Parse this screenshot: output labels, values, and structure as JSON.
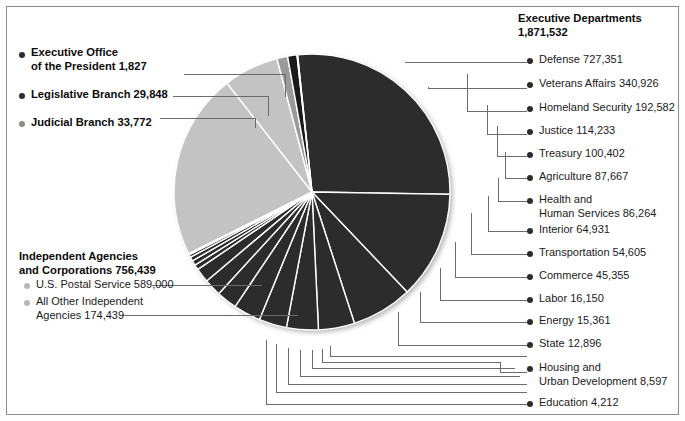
{
  "chart_data": {
    "type": "pie",
    "title": "",
    "unit": "employees",
    "total": 2693418,
    "legend_position": "left-and-right",
    "groups": [
      {
        "name": "Executive Departments",
        "total": "1,871,532",
        "total_value": 1871532,
        "side": "right",
        "bullet": "dark",
        "items": [
          {
            "label": "Defense",
            "value_text": "727,351",
            "value": 727351
          },
          {
            "label": "Veterans Affairs",
            "value_text": "340,926",
            "value": 340926
          },
          {
            "label": "Homeland Security",
            "value_text": "192,582",
            "value": 192582
          },
          {
            "label": "Justice",
            "value_text": "114,233",
            "value": 114233
          },
          {
            "label": "Treasury",
            "value_text": "100,402",
            "value": 100402
          },
          {
            "label": "Agriculture",
            "value_text": "87,667",
            "value": 87667
          },
          {
            "label": "Health and Human Services",
            "label_line1": "Health and",
            "label_line2": "Human Services",
            "value_text": "86,264",
            "value": 86264
          },
          {
            "label": "Interior",
            "value_text": "64,931",
            "value": 64931
          },
          {
            "label": "Transportation",
            "value_text": "54,605",
            "value": 54605
          },
          {
            "label": "Commerce",
            "value_text": "45,355",
            "value": 45355
          },
          {
            "label": "Labor",
            "value_text": "16,150",
            "value": 16150
          },
          {
            "label": "Energy",
            "value_text": "15,361",
            "value": 15361
          },
          {
            "label": "State",
            "value_text": "12,896",
            "value": 12896
          },
          {
            "label": "Housing and Urban Development",
            "label_line1": "Housing and",
            "label_line2": "Urban Development",
            "value_text": "8,597",
            "value": 8597
          },
          {
            "label": "Education",
            "value_text": "4,212",
            "value": 4212
          }
        ]
      },
      {
        "name": "Independent Agencies and Corporations",
        "name_line1": "Independent Agencies",
        "name_line2": "and Corporations",
        "total": "756,439",
        "total_value": 756439,
        "side": "left",
        "bullet": "light",
        "items": [
          {
            "label": "U.S. Postal Service",
            "value_text": "589,000",
            "value": 589000
          },
          {
            "label": "All Other Independent Agencies",
            "label_line1": "All Other Independent",
            "label_line2": "Agencies",
            "value_text": "174,439",
            "value": 174439
          }
        ]
      },
      {
        "name": "Other Branches",
        "side": "left",
        "bullet": "mixed",
        "items": [
          {
            "label": "Executive Office of the President",
            "label_line1": "Executive Office",
            "label_line2": "of the President",
            "value_text": "1,827",
            "value": 1827,
            "bullet": "dark"
          },
          {
            "label": "Legislative Branch",
            "value_text": "29,848",
            "value": 29848,
            "bullet": "dark"
          },
          {
            "label": "Judicial Branch",
            "value_text": "33,772",
            "value": 33772,
            "bullet": "mid"
          }
        ]
      }
    ],
    "slices": [
      {
        "label": "Defense",
        "value": 727351,
        "color": "#2c2c2c"
      },
      {
        "label": "Veterans Affairs",
        "value": 340926,
        "color": "#2c2c2c"
      },
      {
        "label": "Homeland Security",
        "value": 192582,
        "color": "#2c2c2c"
      },
      {
        "label": "Justice",
        "value": 114233,
        "color": "#2c2c2c"
      },
      {
        "label": "Treasury",
        "value": 100402,
        "color": "#2c2c2c"
      },
      {
        "label": "Agriculture",
        "value": 87667,
        "color": "#2c2c2c"
      },
      {
        "label": "Health and Human Services",
        "value": 86264,
        "color": "#2c2c2c"
      },
      {
        "label": "Interior",
        "value": 64931,
        "color": "#2c2c2c"
      },
      {
        "label": "Transportation",
        "value": 54605,
        "color": "#2c2c2c"
      },
      {
        "label": "Commerce",
        "value": 45355,
        "color": "#2c2c2c"
      },
      {
        "label": "Labor",
        "value": 16150,
        "color": "#2c2c2c"
      },
      {
        "label": "Energy",
        "value": 15361,
        "color": "#2c2c2c"
      },
      {
        "label": "State",
        "value": 12896,
        "color": "#2c2c2c"
      },
      {
        "label": "Housing and Urban Development",
        "value": 8597,
        "color": "#2c2c2c"
      },
      {
        "label": "Education",
        "value": 4212,
        "color": "#2c2c2c"
      },
      {
        "label": "U.S. Postal Service",
        "value": 589000,
        "color": "#c3c3c3"
      },
      {
        "label": "All Other Independent Agencies",
        "value": 174439,
        "color": "#c3c3c3"
      },
      {
        "label": "Judicial Branch",
        "value": 33772,
        "color": "#9a9a9a"
      },
      {
        "label": "Legislative Branch",
        "value": 29848,
        "color": "#1a1a1a"
      },
      {
        "label": "Executive Office of the President",
        "value": 1827,
        "color": "#1a1a1a"
      }
    ],
    "colors": {
      "executive_departments": "#2c2c2c",
      "independent_agencies": "#c3c3c3",
      "judicial": "#9a9a9a",
      "legislative": "#1a1a1a",
      "executive_office": "#1a1a1a",
      "separator": "#ffffff",
      "leader_line": "#6b6b6b",
      "frame": "#8c8c8c"
    }
  },
  "right_legend": {
    "header_line1": "Executive Departments",
    "header_line2": "1,871,532",
    "rows": [
      {
        "text": "Defense  727,351"
      },
      {
        "text": "Veterans Affairs  340,926"
      },
      {
        "text": "Homeland Security  192,582"
      },
      {
        "text": "Justice  114,233"
      },
      {
        "text": "Treasury  100,402"
      },
      {
        "text": "Agriculture  87,667"
      },
      {
        "text": "Health and",
        "text2": "Human Services  86,264"
      },
      {
        "text": "Interior  64,931"
      },
      {
        "text": "Transportation  54,605"
      },
      {
        "text": "Commerce  45,355"
      },
      {
        "text": "Labor  16,150"
      },
      {
        "text": "Energy  15,361"
      },
      {
        "text": "State  12,896"
      },
      {
        "text": "Housing and",
        "text2": "Urban Development  8,597"
      },
      {
        "text": "Education  4,212"
      }
    ]
  },
  "left_legend_top": {
    "rows": [
      {
        "text": "Executive Office",
        "text2": "of the President  1,827"
      },
      {
        "text": "Legislative Branch  29,848"
      },
      {
        "text": "Judicial Branch  33,772"
      }
    ]
  },
  "left_legend_bottom": {
    "header_line1": "Independent Agencies",
    "header_line2": "and Corporations  756,439",
    "rows": [
      {
        "text": "U.S. Postal Service  589,000"
      },
      {
        "text": "All Other Independent",
        "text2": "Agencies  174,439"
      }
    ]
  }
}
